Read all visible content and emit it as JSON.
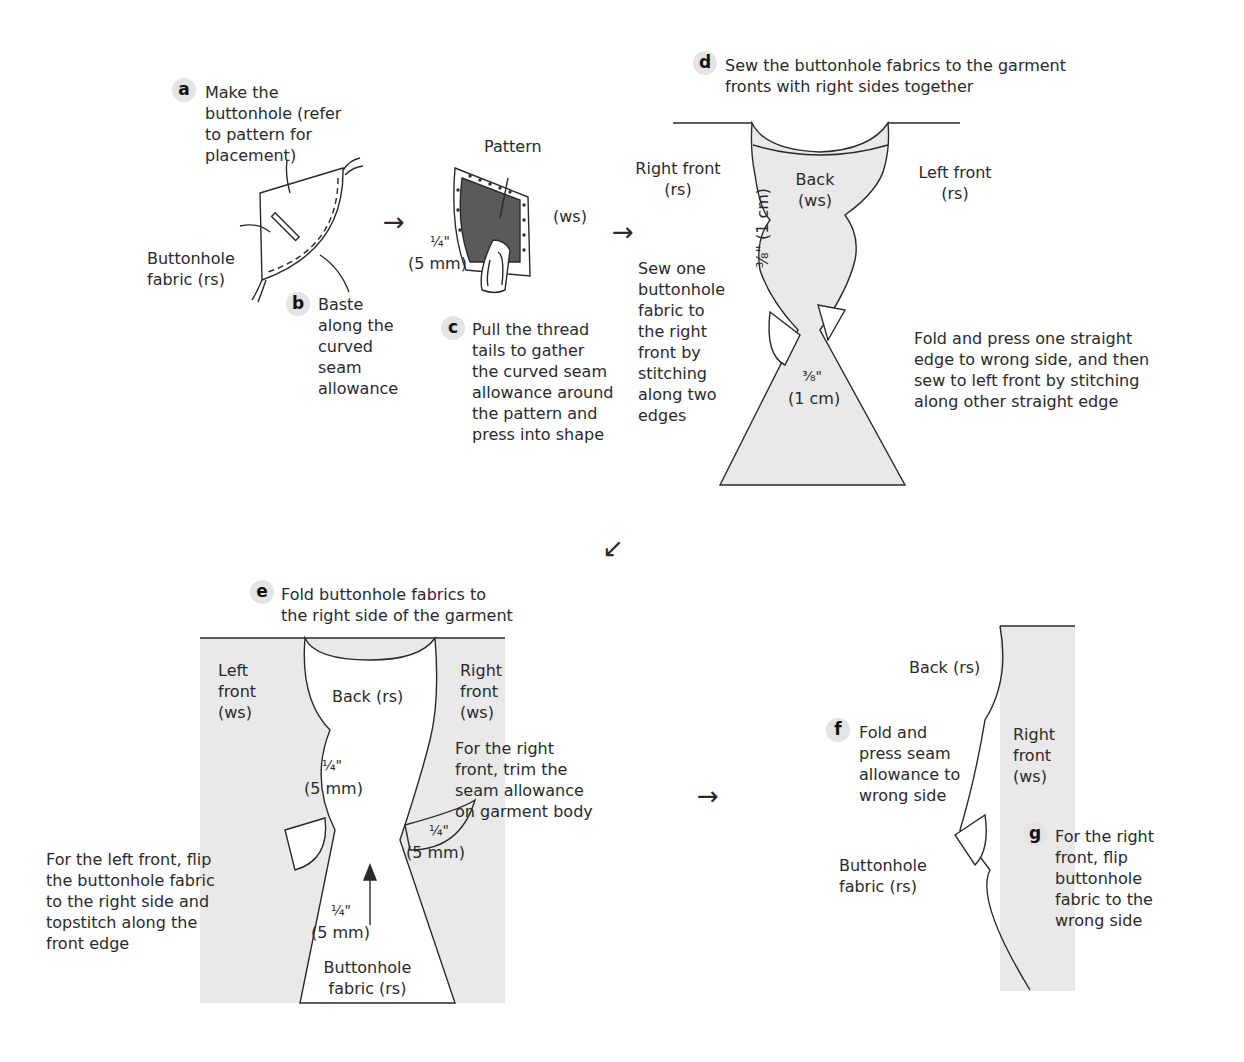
{
  "steps": {
    "a": {
      "letter": "a",
      "text": "Make the\nbuttonhole (refer\nto pattern for\nplacement)"
    },
    "b": {
      "letter": "b",
      "text": "Baste\nalong the\ncurved\nseam\nallowance"
    },
    "c": {
      "letter": "c",
      "text": "Pull the thread\ntails to gather\nthe curved seam\nallowance around\nthe pattern and\npress into shape"
    },
    "d": {
      "letter": "d",
      "text": "Sew the buttonhole fabrics to the garment\nfronts with right sides together"
    },
    "e": {
      "letter": "e",
      "text": "Fold buttonhole fabrics to\nthe right side of the garment"
    },
    "f": {
      "letter": "f",
      "text": "Fold and\npress seam\nallowance to\nwrong side"
    },
    "g": {
      "letter": "g",
      "text": "For the right\nfront, flip\nbuttonhole\nfabric to the\nwrong side"
    }
  },
  "labels": {
    "buttonhole_fabric_rs_a": "Buttonhole\nfabric (rs)",
    "pattern": "Pattern",
    "ws_c": "(ws)",
    "quarter_inch_c": "¼\"",
    "five_mm_c": "(5 mm)",
    "right_front_rs": "Right front\n(rs)",
    "left_front_rs": "Left front\n(rs)",
    "back_ws": "Back\n(ws)",
    "three_eighth_vertical": "⅜\" (1 cm)",
    "three_eighth_d": "⅜\"",
    "one_cm_d": "(1 cm)",
    "sew_one_note": "Sew one\nbuttonhole\nfabric to\nthe right\nfront by\nstitching\nalong two\nedges",
    "fold_press_note": "Fold and press one straight\nedge to wrong side, and then\nsew to left front by stitching\nalong other straight edge",
    "left_front_ws": "Left\nfront\n(ws)",
    "back_rs_e": "Back (rs)",
    "right_front_ws_e": "Right\nfront\n(ws)",
    "quarter_inch_e1": "¼\"",
    "five_mm_e1": "(5 mm)",
    "trim_note": "For the right\nfront, trim the\nseam allowance\non garment body",
    "quarter_inch_e2": "¼\"",
    "five_mm_e2": "(5 mm)",
    "quarter_inch_e3": "¼\"",
    "five_mm_e3": "(5 mm)",
    "left_front_flip_note": "For the left front, flip\nthe buttonhole fabric\nto the right side and\ntopstitch along the\nfront edge",
    "buttonhole_fabric_rs_e": "Buttonhole\nfabric (rs)",
    "back_rs_f": "Back (rs)",
    "right_front_ws_f": "Right\nfront\n(ws)",
    "buttonhole_fabric_rs_f": "Buttonhole\nfabric (rs)"
  },
  "arrows": [
    "→",
    "→",
    "↙",
    "→"
  ],
  "colors": {
    "badge_bg": "#e4e4e4",
    "fabric_fill": "#e9e9e9",
    "pattern_fill": "#5a5a5a",
    "line": "#2a2a2a"
  }
}
